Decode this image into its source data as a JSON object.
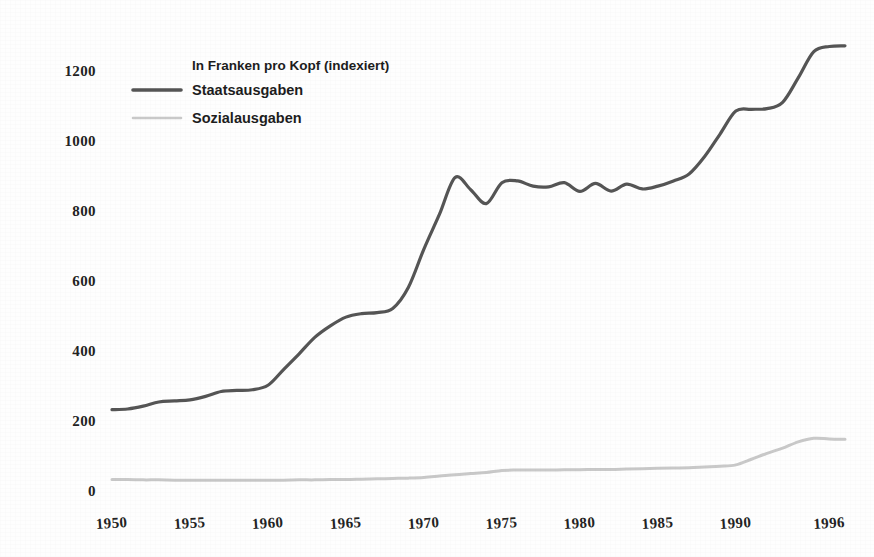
{
  "figure": {
    "background_color": "#fefefe",
    "legend": {
      "title": "In Franken pro Kopf (indexiert)",
      "entries": [
        {
          "label": "Staatsausgaben",
          "color": "#555555"
        },
        {
          "label": "Sozialausgaben",
          "color": "#c9c9c9"
        }
      ]
    }
  },
  "chart_data": {
    "type": "line",
    "title": "",
    "subtitle": "",
    "xlabel": "",
    "ylabel": "",
    "annotation": "In Franken pro Kopf (indexiert)",
    "grid": false,
    "legend_position": "top-left",
    "xlim": [
      1950,
      1997
    ],
    "ylim": [
      0,
      1300
    ],
    "xticks": [
      1950,
      1955,
      1960,
      1965,
      1970,
      1975,
      1980,
      1985,
      1990,
      1996
    ],
    "xtick_labels": [
      "1950",
      "1955",
      "1960",
      "1965",
      "1970",
      "1975",
      "1980",
      "1985",
      "1990",
      "1996"
    ],
    "yticks": [
      0,
      200,
      400,
      600,
      800,
      1000,
      1200
    ],
    "ytick_labels": [
      "0",
      "200",
      "400",
      "600",
      "800",
      "1000",
      "1200"
    ],
    "x": [
      1950,
      1951,
      1952,
      1953,
      1954,
      1955,
      1956,
      1957,
      1958,
      1959,
      1960,
      1961,
      1962,
      1963,
      1964,
      1965,
      1966,
      1967,
      1968,
      1969,
      1970,
      1971,
      1972,
      1973,
      1974,
      1975,
      1976,
      1977,
      1978,
      1979,
      1980,
      1981,
      1982,
      1983,
      1984,
      1985,
      1986,
      1987,
      1988,
      1989,
      1990,
      1991,
      1992,
      1993,
      1994,
      1995,
      1996,
      1997
    ],
    "series": [
      {
        "name": "Staatsausgaben",
        "color": "#555555",
        "line_width": 3.2,
        "values": [
          230,
          232,
          240,
          252,
          255,
          258,
          268,
          282,
          285,
          287,
          300,
          345,
          390,
          437,
          470,
          495,
          505,
          508,
          520,
          580,
          690,
          790,
          895,
          860,
          820,
          880,
          885,
          870,
          868,
          880,
          855,
          878,
          856,
          876,
          862,
          870,
          885,
          905,
          955,
          1020,
          1085,
          1090,
          1092,
          1110,
          1180,
          1255,
          1270,
          1272
        ]
      },
      {
        "name": "Sozialausgaben",
        "color": "#c9c9c9",
        "line_width": 3.0,
        "values": [
          30,
          30,
          29,
          29,
          28,
          28,
          28,
          28,
          28,
          28,
          28,
          28,
          29,
          29,
          30,
          30,
          31,
          32,
          33,
          34,
          36,
          40,
          44,
          47,
          50,
          56,
          57,
          57,
          57,
          58,
          58,
          59,
          59,
          60,
          61,
          62,
          63,
          64,
          66,
          68,
          72,
          88,
          105,
          120,
          138,
          148,
          146,
          145
        ]
      }
    ]
  }
}
